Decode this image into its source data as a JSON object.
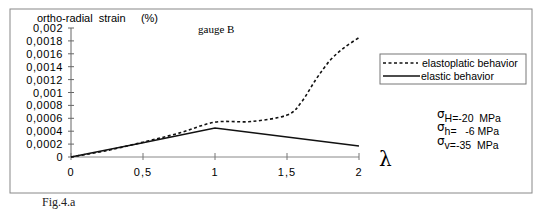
{
  "figure_label": "Fig.4.a",
  "chart_data": {
    "type": "line",
    "title": "gauge B",
    "ylabel": "ortho-radial  strain     (%)",
    "xlabel": "λ",
    "xlim": [
      0,
      2
    ],
    "ylim": [
      0,
      0.002
    ],
    "x_ticks": [
      "0",
      "0,5",
      "1",
      "1,5",
      "2"
    ],
    "x_tick_values": [
      0,
      0.5,
      1,
      1.5,
      2
    ],
    "y_ticks": [
      "0",
      "0,0002",
      "0,0004",
      "0,0006",
      "0,0008",
      "0,001",
      "0,0012",
      "0,0014",
      "0,0016",
      "0,0018",
      "0,002"
    ],
    "y_tick_values": [
      0,
      0.0002,
      0.0004,
      0.0006,
      0.0008,
      0.001,
      0.0012,
      0.0014,
      0.0016,
      0.0018,
      0.002
    ],
    "grid": false,
    "legend_position": "right",
    "series": [
      {
        "name": "elastoplatic behavior",
        "style": "dashed",
        "x": [
          0,
          0.25,
          0.5,
          0.75,
          1,
          1.25,
          1.5,
          1.6,
          1.7,
          1.8,
          1.9,
          2
        ],
        "values": [
          0,
          0.0001,
          0.00023,
          0.00037,
          0.00054,
          0.00055,
          0.00065,
          0.00085,
          0.0012,
          0.0015,
          0.0017,
          0.00185
        ]
      },
      {
        "name": "elastic behavior",
        "style": "solid",
        "x": [
          0,
          0.5,
          1,
          1.5,
          2
        ],
        "values": [
          0,
          0.00022,
          0.00045,
          0.00031,
          0.00017
        ]
      }
    ],
    "annotations": [
      {
        "symbol": "σ",
        "sub": "H=-20  MPa"
      },
      {
        "symbol": "σ",
        "sub": "h=   -6 MPa"
      },
      {
        "symbol": "σ",
        "sub": "v=-35  MPa"
      }
    ]
  }
}
